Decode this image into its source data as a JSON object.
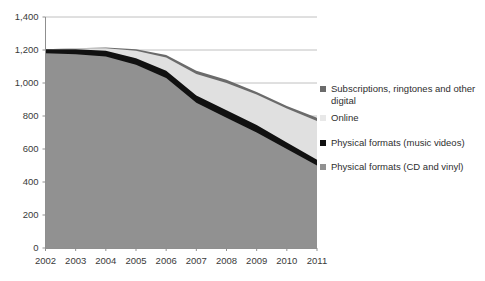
{
  "chart_data": {
    "type": "area",
    "stacked": true,
    "title": "",
    "subtitle": "",
    "xlabel": "",
    "ylabel": "",
    "categories": [
      "2002",
      "2003",
      "2004",
      "2005",
      "2006",
      "2007",
      "2008",
      "2009",
      "2010",
      "2011"
    ],
    "x_tick_labels": [
      "2002",
      "2003",
      "2004",
      "2005",
      "2006",
      "2007",
      "2008",
      "2009",
      "2010",
      "2011"
    ],
    "y_tick_labels": [
      "0",
      "200",
      "400",
      "600",
      "800",
      "1,000",
      "1,200",
      "1,400"
    ],
    "y_tick_values": [
      0,
      200,
      400,
      600,
      800,
      1000,
      1200,
      1400
    ],
    "ylim": [
      0,
      1400
    ],
    "grid": "horizontal",
    "legend_position": "right",
    "series": [
      {
        "name": "Physical formats (CD and vinyl)",
        "color": "#919191",
        "stack_order": 1,
        "values": [
          1180,
          1175,
          1160,
          1110,
          1030,
          880,
          790,
          700,
          600,
          500
        ]
      },
      {
        "name": "Physical formats (music videos)",
        "color": "#111111",
        "stack_order": 2,
        "values": [
          25,
          30,
          35,
          40,
          45,
          45,
          45,
          45,
          40,
          35
        ]
      },
      {
        "name": "Online",
        "color": "#e0e0e0",
        "stack_order": 3,
        "values": [
          0,
          5,
          15,
          45,
          80,
          130,
          165,
          185,
          205,
          235
        ]
      },
      {
        "name": "Subscriptions, ringtones and other digital",
        "color": "#6b6b6b",
        "stack_order": 4,
        "values": [
          0,
          0,
          5,
          10,
          15,
          20,
          20,
          15,
          15,
          20
        ]
      }
    ],
    "totals": [
      1205,
      1210,
      1215,
      1205,
      1170,
      1075,
      1020,
      945,
      860,
      790
    ]
  },
  "legend": {
    "items": [
      {
        "label": "Subscriptions, ringtones and other digital",
        "color": "#6b6b6b"
      },
      {
        "label": "Online",
        "color": "#e8e8e8"
      },
      {
        "label": "Physical formats (music videos)",
        "color": "#111111"
      },
      {
        "label": "Physical formats (CD and vinyl)",
        "color": "#919191"
      }
    ]
  }
}
